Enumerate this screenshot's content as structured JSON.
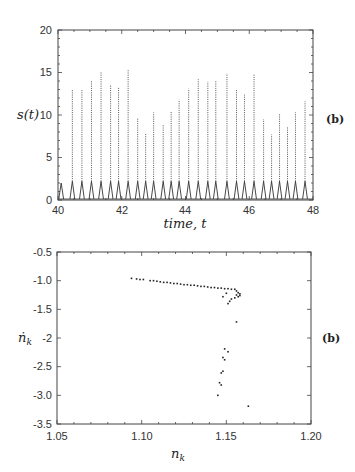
{
  "chart_data": [
    {
      "type": "line",
      "title": "",
      "xlabel": "time, t",
      "ylabel": "s(t)",
      "panel_label": "(b)",
      "xlim": [
        40,
        48
      ],
      "ylim": [
        0,
        20
      ],
      "xticks": [
        "40",
        "42",
        "44",
        "46",
        "48"
      ],
      "yticks": [
        "0",
        "5",
        "10",
        "15",
        "20"
      ],
      "grid": false,
      "series": [
        {
          "name": "s(t) peaks",
          "x": [
            40.1,
            40.45,
            40.75,
            41.05,
            41.35,
            41.65,
            41.9,
            42.2,
            42.5,
            42.75,
            43.0,
            43.3,
            43.55,
            43.8,
            44.1,
            44.4,
            44.7,
            44.95,
            45.3,
            45.6,
            45.85,
            46.15,
            46.45,
            46.7,
            46.95,
            47.2,
            47.45,
            47.75
          ],
          "values": [
            2.0,
            13.0,
            13.0,
            14.0,
            15.0,
            13.6,
            13.3,
            15.4,
            9.7,
            7.9,
            10.3,
            8.8,
            10.4,
            11.8,
            13.1,
            14.2,
            13.9,
            14.0,
            14.9,
            13.0,
            12.4,
            14.8,
            9.5,
            7.7,
            10.2,
            8.6,
            10.3,
            11.6
          ]
        }
      ]
    },
    {
      "type": "scatter",
      "title": "",
      "xlabel": "n_k",
      "ylabel": "ṅ_k",
      "panel_label": "(b)",
      "xlim": [
        1.05,
        1.2
      ],
      "ylim": [
        -3.5,
        -0.5
      ],
      "xticks": [
        "1.05",
        "1.10",
        "1.15",
        "1.20"
      ],
      "yticks": [
        "-0.5",
        "-1.0",
        "-1.5",
        "-2",
        "-2.5",
        "-3.0",
        "-3.5"
      ],
      "grid": false,
      "series": [
        {
          "name": "return map points",
          "x": [
            1.094,
            1.097,
            1.099,
            1.101,
            1.105,
            1.107,
            1.109,
            1.111,
            1.113,
            1.115,
            1.117,
            1.119,
            1.121,
            1.123,
            1.125,
            1.127,
            1.129,
            1.131,
            1.133,
            1.135,
            1.137,
            1.139,
            1.141,
            1.143,
            1.145,
            1.147,
            1.149,
            1.151,
            1.153,
            1.155,
            1.156,
            1.157,
            1.158,
            1.158,
            1.157,
            1.156,
            1.155,
            1.153,
            1.152,
            1.151,
            1.148,
            1.15,
            1.156,
            1.149,
            1.151,
            1.148,
            1.149,
            1.148,
            1.147,
            1.146,
            1.147,
            1.145,
            1.163
          ],
          "values": [
            -0.96,
            -0.97,
            -0.98,
            -0.98,
            -1.0,
            -1.0,
            -1.01,
            -1.02,
            -1.03,
            -1.03,
            -1.04,
            -1.05,
            -1.05,
            -1.06,
            -1.07,
            -1.07,
            -1.08,
            -1.08,
            -1.09,
            -1.1,
            -1.1,
            -1.11,
            -1.12,
            -1.12,
            -1.13,
            -1.13,
            -1.14,
            -1.14,
            -1.15,
            -1.15,
            -1.18,
            -1.21,
            -1.23,
            -1.26,
            -1.28,
            -1.25,
            -1.3,
            -1.32,
            -1.36,
            -1.4,
            -1.28,
            -1.22,
            -1.72,
            -2.19,
            -2.24,
            -2.34,
            -2.38,
            -2.58,
            -2.61,
            -2.78,
            -2.82,
            -3.0,
            -3.19
          ]
        }
      ]
    }
  ],
  "top_plot": {
    "ylabel": "s(t)",
    "xlabel": "time, t",
    "panel_label": "(b)",
    "xticks": [
      "40",
      "42",
      "44",
      "46",
      "48"
    ],
    "yticks": [
      "0",
      "5",
      "10",
      "15",
      "20"
    ]
  },
  "bottom_plot": {
    "ylabel": "ṅ",
    "ylabel_sub": "k",
    "xlabel": "n",
    "xlabel_sub": "k",
    "panel_label": "(b)",
    "xticks": [
      "1.05",
      "1.10",
      "1.15",
      "1.20"
    ],
    "yticks": [
      "-0.5",
      "-1.0",
      "-1.5",
      "-2",
      "-2.5",
      "-3.0",
      "-3.5"
    ]
  }
}
